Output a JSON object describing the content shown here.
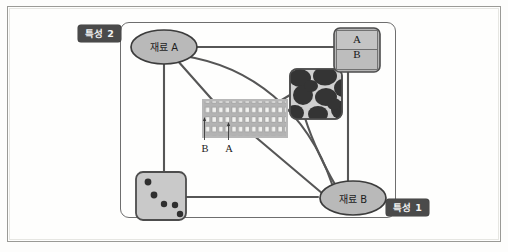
{
  "figure": {
    "type": "concept-relationship-diagram",
    "axes": {
      "vertical_label": "특성 2",
      "horizontal_label": "특성 1"
    },
    "nodes": {
      "material_a": "재료 A",
      "material_b": "재료 B"
    },
    "ab_stack": {
      "top_label": "A",
      "bottom_label": "B"
    },
    "lamellar_leaders": {
      "left_label": "B",
      "right_label": "A"
    },
    "colors": {
      "chip_background": "#4a4a4a",
      "chip_text": "#f2f2f2",
      "node_fill": "#b9b9b9",
      "node_stroke": "#3c3c3c",
      "connector": "#555555",
      "panel_border": "#6e6e6e",
      "tile_fill": "#c6c6c6",
      "blob_dark": "#3a3a3a",
      "frame_border": "#9a9a96"
    },
    "micrographs": [
      {
        "name": "lamellar-structure",
        "description": "layered grid of bright rectangles"
      },
      {
        "name": "blob-structure",
        "description": "dark irregular blob phases"
      },
      {
        "name": "dispersed-particles",
        "description": "five dark round particles"
      },
      {
        "name": "ab-layer-stack",
        "description": "two stacked layers labelled A over B"
      }
    ]
  }
}
